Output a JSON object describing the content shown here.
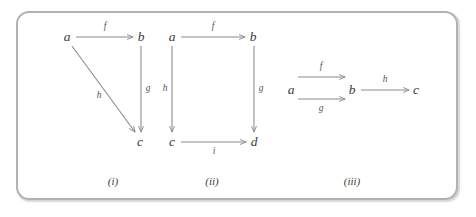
{
  "figure": {
    "background_color": "#ffffff",
    "frame_color": "#b2b2b2",
    "line_color": "#8c8c8c",
    "text_color": "#3a3a3a",
    "panels": [
      {
        "id": "i",
        "caption": "(i)",
        "caption_x": 113,
        "caption_y": 181,
        "nodes": [
          {
            "id": "a",
            "label": "a",
            "x": 67,
            "y": 37
          },
          {
            "id": "b",
            "label": "b",
            "x": 141,
            "y": 37
          },
          {
            "id": "c",
            "label": "c",
            "x": 140,
            "y": 142
          }
        ],
        "edges": [
          {
            "id": "f",
            "label": "f",
            "from": "a",
            "to": "b",
            "x1": 76,
            "y1": 37,
            "x2": 133,
            "y2": 37,
            "label_x": 105,
            "label_y": 27
          },
          {
            "id": "g",
            "label": "g",
            "from": "b",
            "to": "c",
            "x1": 141,
            "y1": 46,
            "x2": 141,
            "y2": 132,
            "label_x": 148,
            "label_y": 89
          },
          {
            "id": "h",
            "label": "h",
            "from": "a",
            "to": "c",
            "x1": 72,
            "y1": 46,
            "x2": 135,
            "y2": 132,
            "label_x": 99,
            "label_y": 96
          }
        ]
      },
      {
        "id": "ii",
        "caption": "(ii)",
        "caption_x": 212,
        "caption_y": 181,
        "nodes": [
          {
            "id": "a",
            "label": "a",
            "x": 172,
            "y": 37
          },
          {
            "id": "b",
            "label": "b",
            "x": 253,
            "y": 37
          },
          {
            "id": "c",
            "label": "c",
            "x": 172,
            "y": 142
          },
          {
            "id": "d",
            "label": "d",
            "x": 254,
            "y": 142
          }
        ],
        "edges": [
          {
            "id": "f",
            "label": "f",
            "from": "a",
            "to": "b",
            "x1": 181,
            "y1": 37,
            "x2": 245,
            "y2": 37,
            "label_x": 213,
            "label_y": 27
          },
          {
            "id": "h",
            "label": "h",
            "from": "a",
            "to": "c",
            "x1": 172,
            "y1": 46,
            "x2": 172,
            "y2": 132,
            "label_x": 165,
            "label_y": 89
          },
          {
            "id": "g",
            "label": "g",
            "from": "b",
            "to": "d",
            "x1": 254,
            "y1": 46,
            "x2": 254,
            "y2": 132,
            "label_x": 261,
            "label_y": 89
          },
          {
            "id": "i",
            "label": "i",
            "from": "c",
            "to": "d",
            "x1": 181,
            "y1": 142,
            "x2": 246,
            "y2": 142,
            "label_x": 214,
            "label_y": 152
          }
        ]
      },
      {
        "id": "iii",
        "caption": "(iii)",
        "caption_x": 352,
        "caption_y": 181,
        "nodes": [
          {
            "id": "a",
            "label": "a",
            "x": 291,
            "y": 90
          },
          {
            "id": "b",
            "label": "b",
            "x": 352,
            "y": 90
          },
          {
            "id": "c",
            "label": "c",
            "x": 416,
            "y": 90
          }
        ],
        "edges": [
          {
            "id": "f",
            "label": "f",
            "from": "a",
            "to": "b",
            "x1": 298,
            "y1": 77,
            "x2": 345,
            "y2": 77,
            "label_x": 321,
            "label_y": 67
          },
          {
            "id": "g",
            "label": "g",
            "from": "a",
            "to": "b",
            "x1": 298,
            "y1": 99,
            "x2": 345,
            "y2": 99,
            "label_x": 321,
            "label_y": 109
          },
          {
            "id": "h",
            "label": "h",
            "from": "b",
            "to": "c",
            "x1": 361,
            "y1": 90,
            "x2": 409,
            "y2": 90,
            "label_x": 385,
            "label_y": 80
          }
        ]
      }
    ]
  }
}
